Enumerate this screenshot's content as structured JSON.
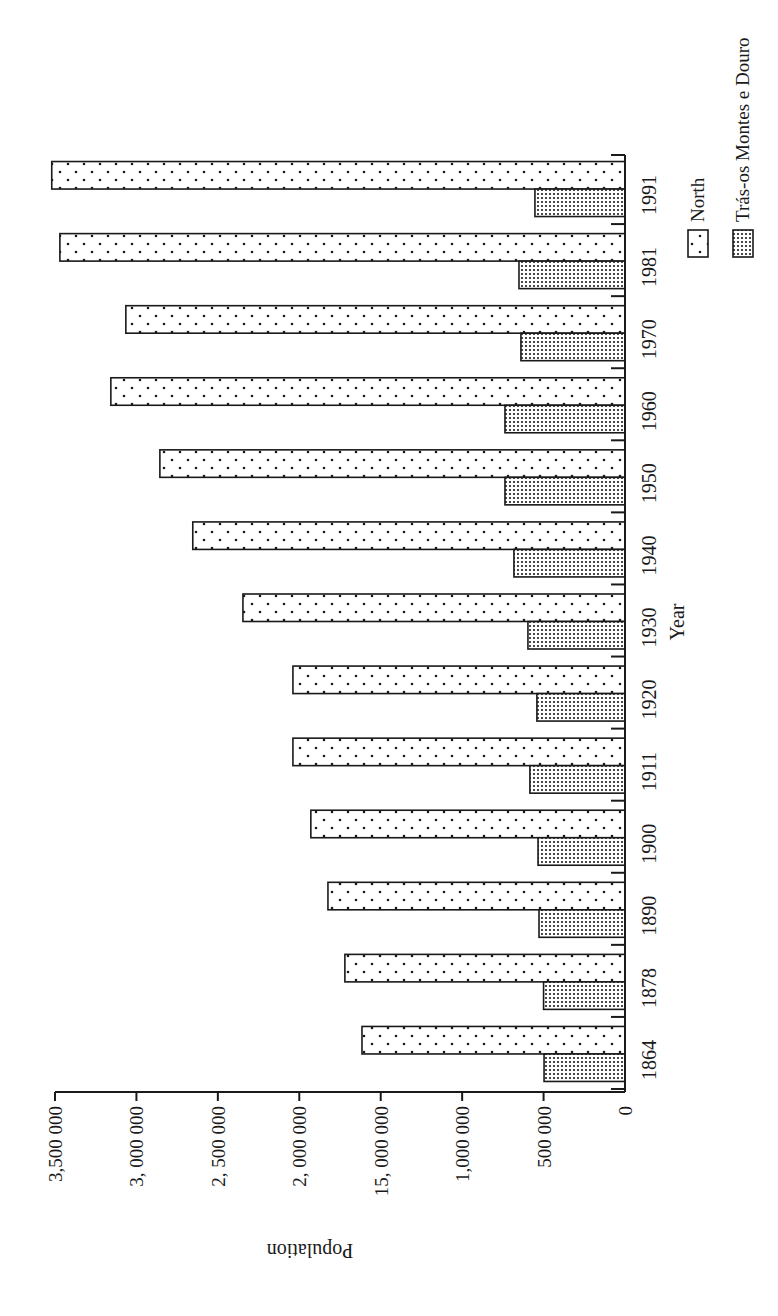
{
  "chart_data": {
    "type": "bar",
    "orientation": "rotated-90-ccw (vertical bars printed sideways)",
    "title": "",
    "xlabel": "Year",
    "ylabel": "Population",
    "ylim": [
      0,
      3500000
    ],
    "yticks": [
      0,
      500000,
      1000000,
      1500000,
      2000000,
      2500000,
      3000000,
      3500000
    ],
    "ytick_labels": [
      "0",
      "500 000",
      "1,000 000",
      "15, 000 000",
      "2, 000 000",
      "2, 500 000",
      "3, 000 000",
      "3,500 000"
    ],
    "categories": [
      "1864",
      "1878",
      "1890",
      "1900",
      "1911",
      "1920",
      "1930",
      "1940",
      "1950",
      "1960",
      "1970",
      "1981",
      "1991"
    ],
    "series": [
      {
        "name": "North",
        "pattern": "sparse-dots",
        "values": [
          1615000,
          1720000,
          1824000,
          1929000,
          2039000,
          2039000,
          2346000,
          2654000,
          2856000,
          3157000,
          3065000,
          3470000,
          3520000
        ]
      },
      {
        "name": "Trás-os Montes e Douro",
        "pattern": "dense-dots",
        "values": [
          497000,
          500000,
          528000,
          534000,
          584000,
          541000,
          596000,
          682000,
          737000,
          737000,
          639000,
          651000,
          553000
        ]
      }
    ],
    "grid": false,
    "legend_position": "right (top in rotated view)"
  },
  "legend": {
    "items": [
      {
        "label": "North"
      },
      {
        "label": "Trás-os Montes e Douro"
      }
    ]
  },
  "colors": {
    "ink": "#1a1a1a",
    "background": "#ffffff"
  }
}
